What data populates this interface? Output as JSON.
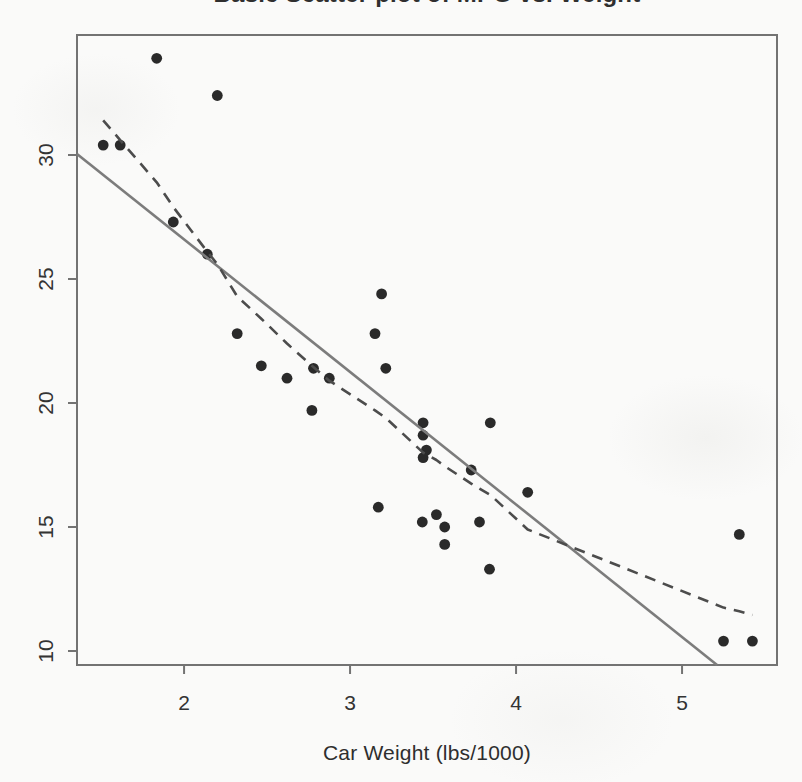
{
  "page": {
    "background_color": "#fafaf9"
  },
  "chart_data": {
    "type": "scatter",
    "title": "Basic Scatter plot of MPG vs. Weight",
    "xlabel": "Car Weight (lbs/1000)",
    "ylabel": "",
    "x_ticks": [
      2,
      3,
      4,
      5
    ],
    "y_ticks": [
      10,
      15,
      20,
      25,
      30
    ],
    "xlim": [
      1.355,
      5.572
    ],
    "ylim": [
      9.435,
      34.84
    ],
    "grid": false,
    "legend": null,
    "points": [
      [
        2.62,
        21.0
      ],
      [
        2.875,
        21.0
      ],
      [
        2.32,
        22.8
      ],
      [
        3.215,
        21.4
      ],
      [
        3.44,
        18.7
      ],
      [
        3.46,
        18.1
      ],
      [
        3.57,
        14.3
      ],
      [
        3.19,
        24.4
      ],
      [
        3.15,
        22.8
      ],
      [
        3.44,
        19.2
      ],
      [
        3.44,
        17.8
      ],
      [
        4.07,
        16.4
      ],
      [
        3.73,
        17.3
      ],
      [
        3.78,
        15.2
      ],
      [
        5.25,
        10.4
      ],
      [
        5.424,
        10.4
      ],
      [
        5.345,
        14.7
      ],
      [
        2.2,
        32.4
      ],
      [
        1.615,
        30.4
      ],
      [
        1.835,
        33.9
      ],
      [
        2.465,
        21.5
      ],
      [
        3.52,
        15.5
      ],
      [
        3.435,
        15.2
      ],
      [
        3.84,
        13.3
      ],
      [
        3.845,
        19.2
      ],
      [
        1.935,
        27.3
      ],
      [
        2.14,
        26.0
      ],
      [
        1.513,
        30.4
      ],
      [
        3.17,
        15.8
      ],
      [
        2.77,
        19.7
      ],
      [
        3.57,
        15.0
      ],
      [
        2.78,
        21.4
      ]
    ],
    "regression_line": {
      "line_style": "solid",
      "endpoints": [
        [
          1.355,
          30.045
        ],
        [
          5.211,
          9.435
        ]
      ]
    },
    "smooth_line": {
      "line_style": "dashed",
      "points": [
        [
          1.513,
          31.4
        ],
        [
          1.615,
          30.6
        ],
        [
          1.835,
          28.9
        ],
        [
          1.935,
          27.9
        ],
        [
          2.14,
          26.1
        ],
        [
          2.2,
          25.6
        ],
        [
          2.32,
          24.3
        ],
        [
          2.465,
          23.4
        ],
        [
          2.62,
          22.4
        ],
        [
          2.77,
          21.5
        ],
        [
          2.875,
          20.9
        ],
        [
          3.15,
          19.7
        ],
        [
          3.215,
          19.4
        ],
        [
          3.44,
          18.0
        ],
        [
          3.52,
          17.7
        ],
        [
          3.57,
          17.45
        ],
        [
          3.73,
          16.75
        ],
        [
          3.78,
          16.55
        ],
        [
          3.845,
          16.3
        ],
        [
          4.07,
          14.9
        ],
        [
          5.25,
          11.75
        ],
        [
          5.345,
          11.6
        ],
        [
          5.424,
          11.45
        ]
      ]
    },
    "colors": {
      "point": "#2a2a2a",
      "solid_line": "#7c7c7c",
      "dashed_line": "#4c4c4c",
      "axis": "#737373",
      "text": "#333333",
      "background": "#fafaf9"
    }
  }
}
